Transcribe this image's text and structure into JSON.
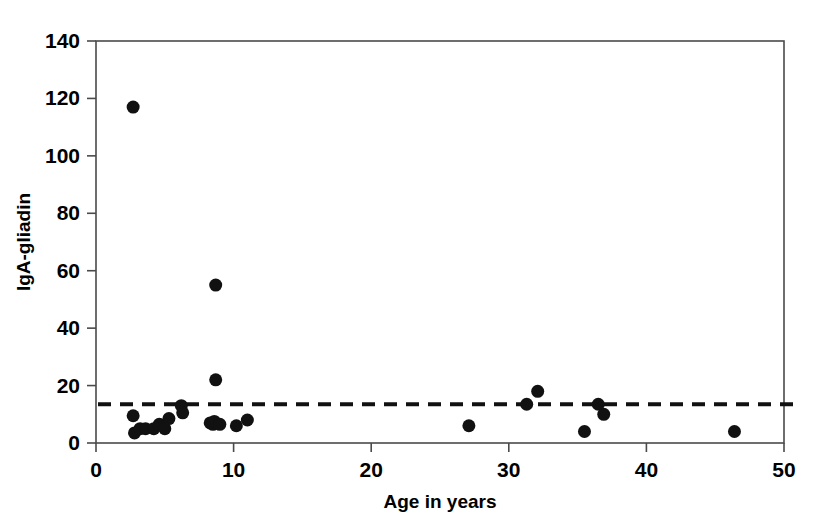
{
  "chart_data": {
    "type": "scatter",
    "title": "",
    "xlabel": "Age in years",
    "ylabel": "IgA-gliadin",
    "xlim": [
      0,
      50
    ],
    "ylim": [
      0,
      140
    ],
    "xticks": [
      0,
      10,
      20,
      30,
      40,
      50
    ],
    "yticks": [
      0,
      20,
      40,
      60,
      80,
      100,
      120,
      140
    ],
    "xtick_labels": [
      "0",
      "10",
      "20",
      "30",
      "40",
      "50"
    ],
    "ytick_labels": [
      "0",
      "20",
      "40",
      "60",
      "80",
      "100",
      "120",
      "140"
    ],
    "grid": false,
    "legend": null,
    "marker": "filled-circle",
    "marker_color": "#111111",
    "marker_size_px": 13,
    "threshold": {
      "name": "cut-off",
      "value": 13.5,
      "style": "dashed",
      "color": "#111111"
    },
    "x": [
      2.7,
      2.7,
      2.8,
      3.2,
      3.6,
      4.2,
      4.6,
      5.0,
      5.3,
      6.2,
      6.3,
      8.3,
      8.5,
      8.6,
      8.7,
      8.7,
      9.0,
      10.2,
      11.0,
      27.1,
      31.3,
      32.1,
      35.5,
      36.5,
      36.9,
      46.4
    ],
    "y": [
      117,
      9.5,
      3.5,
      5.0,
      5.0,
      5.0,
      6.5,
      5.0,
      8.5,
      13.0,
      10.5,
      7.0,
      6.5,
      7.5,
      55,
      22,
      6.5,
      6.0,
      8.0,
      6.0,
      13.5,
      18.0,
      4.0,
      13.5,
      10.0,
      4.0
    ],
    "points": [
      {
        "x": 2.7,
        "y": 117
      },
      {
        "x": 2.7,
        "y": 9.5
      },
      {
        "x": 2.8,
        "y": 3.5
      },
      {
        "x": 3.2,
        "y": 5.0
      },
      {
        "x": 3.6,
        "y": 5.0
      },
      {
        "x": 4.2,
        "y": 5.0
      },
      {
        "x": 4.6,
        "y": 6.5
      },
      {
        "x": 5.0,
        "y": 5.0
      },
      {
        "x": 5.3,
        "y": 8.5
      },
      {
        "x": 6.2,
        "y": 13.0
      },
      {
        "x": 6.3,
        "y": 10.5
      },
      {
        "x": 8.3,
        "y": 7.0
      },
      {
        "x": 8.5,
        "y": 6.5
      },
      {
        "x": 8.6,
        "y": 7.5
      },
      {
        "x": 8.7,
        "y": 55
      },
      {
        "x": 8.7,
        "y": 22
      },
      {
        "x": 9.0,
        "y": 6.5
      },
      {
        "x": 10.2,
        "y": 6.0
      },
      {
        "x": 11.0,
        "y": 8.0
      },
      {
        "x": 27.1,
        "y": 6.0
      },
      {
        "x": 31.3,
        "y": 13.5
      },
      {
        "x": 32.1,
        "y": 18.0
      },
      {
        "x": 35.5,
        "y": 4.0
      },
      {
        "x": 36.5,
        "y": 13.5
      },
      {
        "x": 36.9,
        "y": 10.0
      },
      {
        "x": 46.4,
        "y": 4.0
      }
    ],
    "n_points": 26
  },
  "axes": {
    "x_title": "Age in years",
    "y_title": "IgA-gliadin"
  }
}
